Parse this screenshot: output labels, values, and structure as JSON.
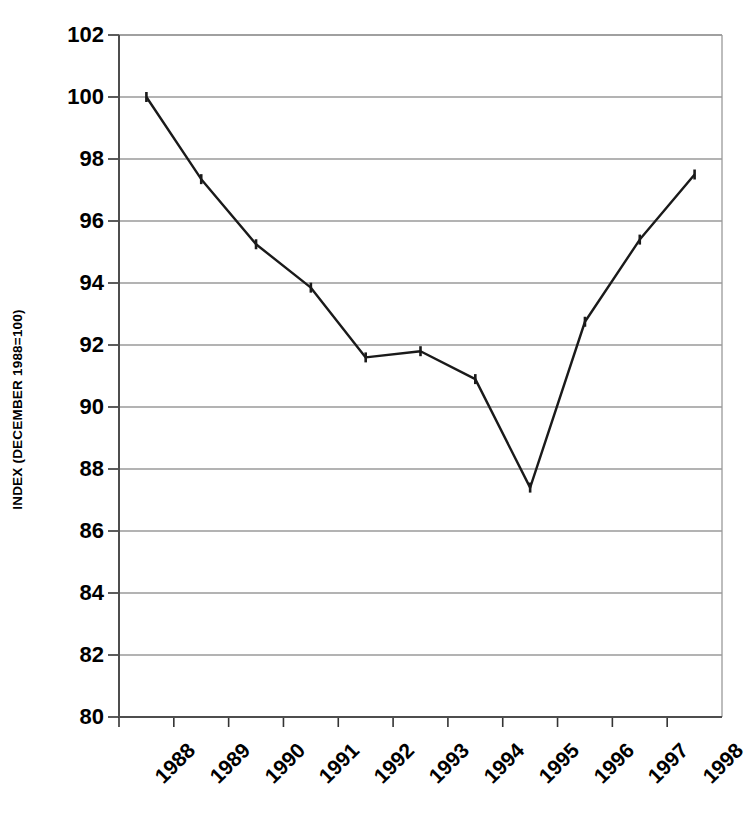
{
  "chart_data": {
    "type": "line",
    "title": "",
    "xlabel": "",
    "ylabel": "INDEX (DECEMBER 1988=100)",
    "grid": true,
    "legend": false,
    "xlim": [
      1988,
      1999
    ],
    "ylim": [
      80,
      102
    ],
    "ytick_step": 2,
    "x_tick_labels": [
      "1988",
      "1989",
      "1990",
      "1991",
      "1992",
      "1993",
      "1994",
      "1995",
      "1996",
      "1997",
      "1998"
    ],
    "y_tick_labels": [
      "80",
      "82",
      "84",
      "86",
      "88",
      "90",
      "92",
      "94",
      "96",
      "98",
      "100",
      "102"
    ],
    "categories": [
      "1988",
      "1989",
      "1990",
      "1991",
      "1992",
      "1993",
      "1994",
      "1995",
      "1996",
      "1997",
      "1998"
    ],
    "x": [
      1988.5,
      1989.5,
      1990.5,
      1991.5,
      1992.5,
      1993.5,
      1994.5,
      1995.5,
      1996.5,
      1997.5,
      1998.5
    ],
    "values": [
      100.0,
      97.35,
      95.25,
      93.85,
      91.6,
      91.8,
      90.9,
      87.4,
      92.75,
      95.4,
      97.5
    ],
    "series": [
      {
        "name": "Index",
        "color": "#000000",
        "marker": "tick",
        "values": [
          100.0,
          97.35,
          95.25,
          93.85,
          91.6,
          91.8,
          90.9,
          87.4,
          92.75,
          95.4,
          97.5
        ]
      }
    ],
    "colors": {
      "line": "#1a1a1a",
      "grid": "#9a9a9a",
      "axis": "#4d4d4d",
      "background": "#ffffff"
    }
  }
}
